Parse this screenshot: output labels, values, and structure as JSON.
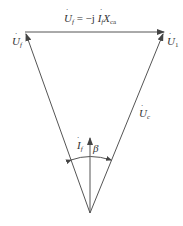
{
  "diagram": {
    "type": "phasor-diagram",
    "labels": {
      "top_equation": "U̇f = −j İf Xca",
      "top_equation_parts": {
        "lhs": "U̇",
        "lhs_sub": "f",
        "eq": " = −j ",
        "i": "İ",
        "i_sub": "f",
        "x": "X",
        "x_sub": "ca"
      },
      "left": {
        "main": "U̇",
        "sub": "f"
      },
      "right": {
        "main": "U̇",
        "sub": "1"
      },
      "right_side": {
        "main": "U̇",
        "sub": "c"
      },
      "current": {
        "main": "İ",
        "sub": "f"
      },
      "angle": "β"
    },
    "colors": {
      "line": "#555555",
      "text": "#333333"
    }
  }
}
